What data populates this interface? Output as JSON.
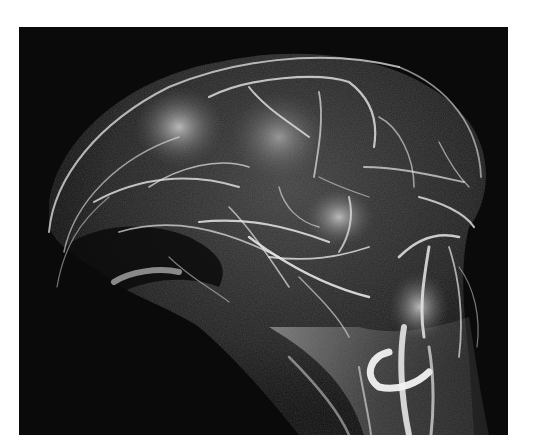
{
  "image": {
    "subject": "3D volume-rendered angiography of a head showing blood vessels",
    "palette": {
      "background_page": "#ffffff",
      "background_frame": "#0a0a0a",
      "tissue": "#8a8a8a",
      "vessel": "#e8e8e8",
      "highlight": "#ffffff"
    }
  }
}
